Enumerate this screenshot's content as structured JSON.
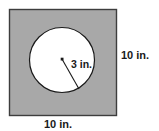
{
  "figure": {
    "type": "geometry-diagram",
    "colors": {
      "square_fill": "#a8a8a8",
      "square_stroke": "#3d3d3d",
      "circle_fill": "#ffffff",
      "circle_stroke": "#1a1a1a",
      "text": "#1a1a1a",
      "background": "#ffffff"
    },
    "square": {
      "side_label": "10 in.",
      "x": 9,
      "y": 9,
      "width": 108,
      "height": 107
    },
    "circle": {
      "radius_label": "3 in.",
      "cx": 62,
      "cy": 60,
      "r": 32.5
    },
    "radius_line": {
      "x1": 62,
      "y1": 59,
      "x2": 79,
      "y2": 89
    },
    "center_dot": {
      "cx": 62,
      "cy": 59,
      "size": 2.6
    }
  },
  "labels": {
    "right_side": "10 in.",
    "bottom_side": "10 in.",
    "radius": "3 in."
  }
}
